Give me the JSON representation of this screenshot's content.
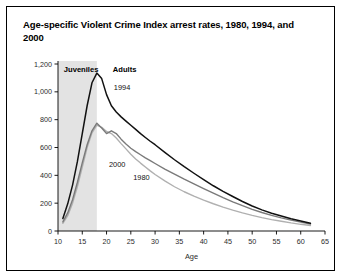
{
  "figure": {
    "title": "Age-specific Violent Crime Index arrest rates, 1980, 1994, and 2000",
    "border_color": "#000000",
    "background": "#ffffff"
  },
  "annotations": {
    "juveniles_label": "Juveniles",
    "adults_label": "Adults",
    "band_color": "#e3e3e3"
  },
  "chart_data": {
    "type": "line",
    "title": "Age-specific Violent Crime Index arrest rates, 1980, 1994, and 2000",
    "xlabel": "Age",
    "ylabel": "",
    "xlim": [
      10,
      65
    ],
    "ylim": [
      0,
      1200
    ],
    "xticks": [
      10,
      15,
      20,
      25,
      30,
      35,
      40,
      45,
      50,
      55,
      60,
      65
    ],
    "yticks": [
      0,
      200,
      400,
      600,
      800,
      1000,
      1200
    ],
    "ytick_labels": [
      "0",
      "200",
      "400",
      "600",
      "800",
      "1,000",
      "1,200"
    ],
    "grid": false,
    "legend": "inline-labels",
    "shaded_region": {
      "label": "Juveniles",
      "x_start": 10,
      "x_end": 18
    },
    "series": [
      {
        "name": "1994",
        "color": "#111111",
        "label_x": 21.5,
        "label_y": 1010,
        "x": [
          11,
          12,
          13,
          14,
          15,
          16,
          17,
          18,
          19,
          20,
          21,
          22,
          23,
          24,
          25,
          26,
          27,
          28,
          29,
          30,
          32,
          34,
          36,
          38,
          40,
          42,
          44,
          46,
          48,
          50,
          52,
          54,
          56,
          58,
          60,
          62
        ],
        "y": [
          90,
          195,
          330,
          500,
          700,
          900,
          1065,
          1135,
          1095,
          980,
          900,
          855,
          820,
          790,
          760,
          730,
          700,
          672,
          645,
          620,
          565,
          512,
          462,
          415,
          370,
          325,
          285,
          248,
          212,
          180,
          152,
          128,
          108,
          88,
          72,
          55
        ]
      },
      {
        "name": "2000",
        "color": "#7a7a7a",
        "label_x": 20.5,
        "label_y": 460,
        "x": [
          11,
          12,
          13,
          14,
          15,
          16,
          17,
          18,
          19,
          20,
          21,
          22,
          23,
          24,
          25,
          26,
          27,
          28,
          29,
          30,
          32,
          34,
          36,
          38,
          40,
          42,
          44,
          46,
          48,
          50,
          52,
          54,
          56,
          58,
          60,
          62
        ],
        "y": [
          65,
          130,
          225,
          350,
          490,
          620,
          720,
          775,
          740,
          700,
          720,
          700,
          660,
          625,
          595,
          570,
          548,
          525,
          505,
          485,
          445,
          408,
          372,
          338,
          305,
          272,
          240,
          210,
          182,
          156,
          133,
          112,
          94,
          78,
          64,
          50
        ]
      },
      {
        "name": "1980",
        "color": "#b0b0b0",
        "label_x": 25.5,
        "label_y": 370,
        "x": [
          11,
          12,
          13,
          14,
          15,
          16,
          17,
          18,
          19,
          20,
          21,
          22,
          23,
          24,
          25,
          26,
          27,
          28,
          29,
          30,
          32,
          34,
          36,
          38,
          40,
          42,
          44,
          46,
          48,
          50,
          52,
          54,
          56,
          58,
          60,
          62
        ],
        "y": [
          55,
          110,
          200,
          320,
          460,
          600,
          705,
          760,
          745,
          715,
          700,
          668,
          628,
          590,
          552,
          518,
          488,
          460,
          432,
          406,
          360,
          318,
          282,
          250,
          222,
          196,
          172,
          150,
          130,
          112,
          96,
          82,
          70,
          58,
          48,
          40
        ]
      }
    ]
  }
}
